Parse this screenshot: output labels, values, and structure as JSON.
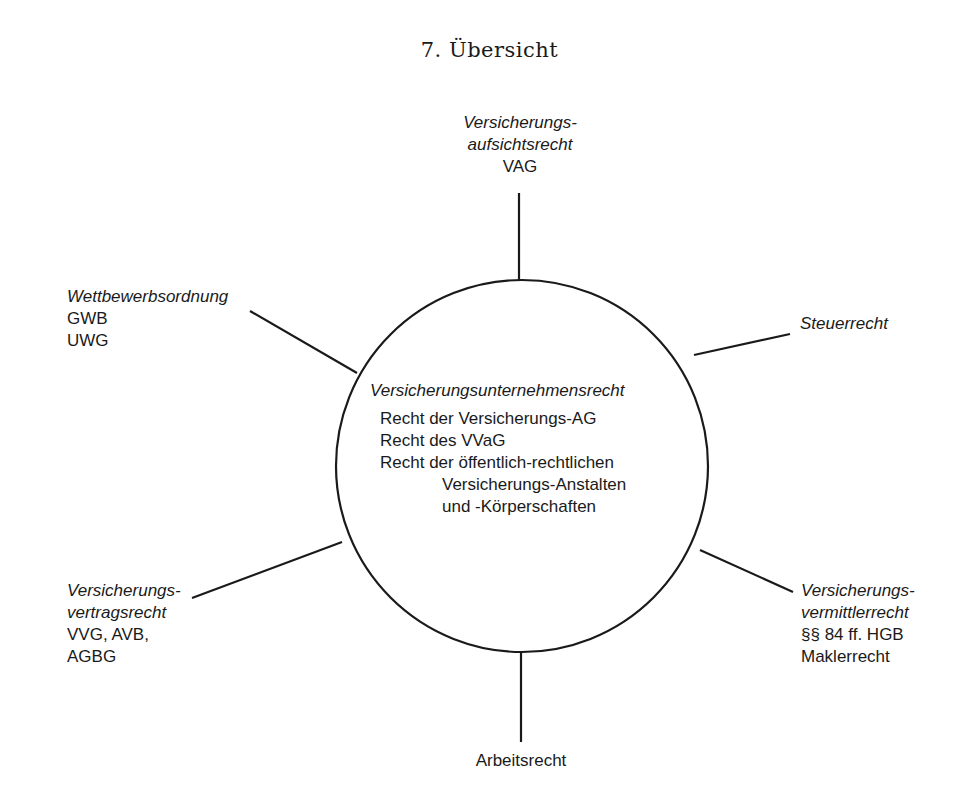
{
  "title": "7.  Übersicht",
  "center": {
    "heading": "Versicherungsunternehmensrecht",
    "lines": [
      "Recht der Versicherungs-AG",
      "Recht des VVaG",
      "Recht der öffentlich-rechtlichen",
      "Versicherungs-Anstalten",
      "und -Körperschaften"
    ]
  },
  "nodes": {
    "top": {
      "lines_italic": [
        "Versicherungs-",
        "aufsichtsrecht"
      ],
      "lines": [
        "VAG"
      ]
    },
    "upper_left": {
      "lines_italic": [
        "Wettbewerbsordnung"
      ],
      "lines": [
        "GWB",
        "UWG"
      ]
    },
    "upper_right": {
      "lines_italic": [
        "Steuerrecht"
      ],
      "lines": []
    },
    "lower_left": {
      "lines_italic": [
        "Versicherungs-",
        "vertragsrecht"
      ],
      "lines": [
        "VVG, AVB,",
        "AGBG"
      ]
    },
    "lower_right": {
      "lines_italic": [
        "Versicherungs-",
        "vermittlerrecht"
      ],
      "lines": [
        "§§ 84 ff. HGB",
        "Maklerrecht"
      ]
    },
    "bottom": {
      "lines_italic": [],
      "lines": [
        "Arbeitsrecht"
      ]
    }
  }
}
